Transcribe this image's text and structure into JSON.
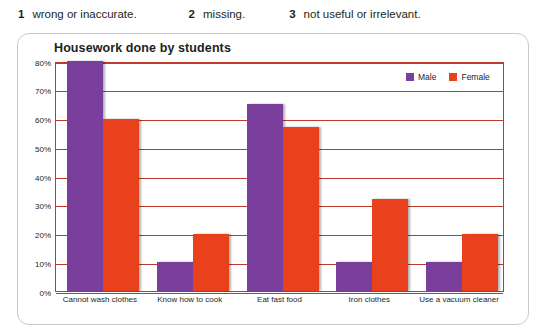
{
  "exercise": {
    "items": [
      {
        "number": "1",
        "text": "wrong or inaccurate."
      },
      {
        "number": "2",
        "text": "missing."
      },
      {
        "number": "3",
        "text": "not useful or irrelevant."
      }
    ]
  },
  "chart_data": {
    "type": "bar",
    "title": "Housework done by students",
    "xlabel": "",
    "ylabel": "",
    "ylim": [
      0,
      80
    ],
    "ytick_labels": [
      "0%",
      "10%",
      "20%",
      "30%",
      "40%",
      "50%",
      "60%",
      "70%",
      "80%"
    ],
    "ytick_values": [
      0,
      10,
      20,
      30,
      40,
      50,
      60,
      70,
      80
    ],
    "grid": true,
    "legend_position": "top-right",
    "categories": [
      "Cannot wash clothes",
      "Know how to cook",
      "Eat fast food",
      "Iron clothes",
      "Use a vacuum cleaner"
    ],
    "series": [
      {
        "name": "Male",
        "color": "#7a3f9d",
        "values": [
          80,
          10,
          65,
          10,
          10
        ]
      },
      {
        "name": "Female",
        "color": "#e8411c",
        "values": [
          60,
          20,
          57,
          32,
          20
        ]
      }
    ]
  }
}
